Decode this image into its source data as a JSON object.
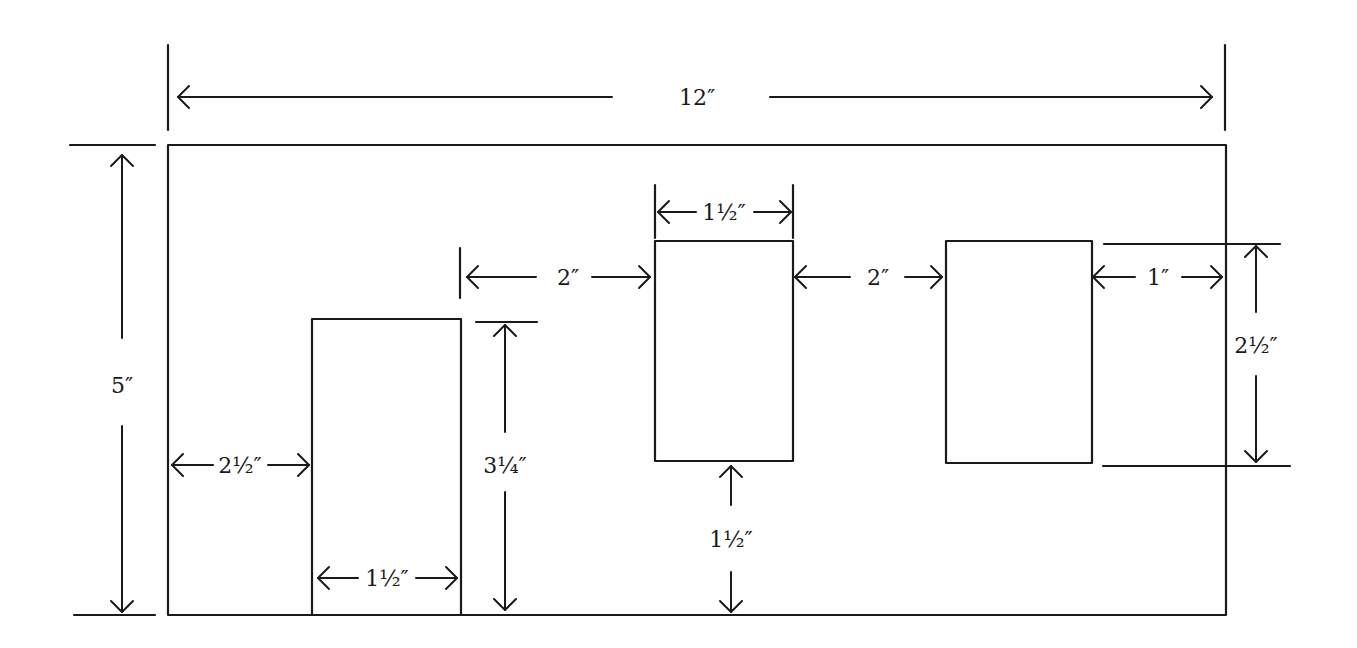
{
  "diagram": {
    "stroke_color": "#1a1a1a",
    "background": "#ffffff",
    "wall": {
      "x1": 168,
      "y1": 145,
      "x2": 1226,
      "y2": 615,
      "width_label": "12″",
      "height_label": "5″"
    },
    "openings": [
      {
        "name": "opening-left",
        "x1": 312,
        "y1": 319,
        "x2": 461,
        "y2": 615
      },
      {
        "name": "opening-center",
        "x1": 655,
        "y1": 241,
        "x2": 793,
        "y2": 461
      },
      {
        "name": "opening-right",
        "x1": 946,
        "y1": 241,
        "x2": 1092,
        "y2": 463
      }
    ],
    "dimensions": [
      {
        "id": "overall-width",
        "label": "12″",
        "orient": "h",
        "a": 178,
        "b": 1212,
        "at": 97,
        "tx": 697,
        "ty": 105,
        "gap": [
          612,
          770
        ]
      },
      {
        "id": "overall-height",
        "label": "5″",
        "orient": "v",
        "a": 155,
        "b": 612,
        "at": 122,
        "tx": 122,
        "ty": 393,
        "gap": [
          338,
          426
        ]
      },
      {
        "id": "left-margin",
        "label": "2½″",
        "orient": "h",
        "a": 172,
        "b": 309,
        "at": 465,
        "tx": 240,
        "ty": 473,
        "gap": [
          213,
          268
        ]
      },
      {
        "id": "left-opening-width",
        "label": "1½″",
        "orient": "h",
        "a": 318,
        "b": 457,
        "at": 578,
        "tx": 387,
        "ty": 586,
        "gap": [
          358,
          416
        ]
      },
      {
        "id": "left-opening-height",
        "label": "3¼″",
        "orient": "v",
        "a": 325,
        "b": 610,
        "at": 505,
        "tx": 505,
        "ty": 473,
        "gap": [
          432,
          492
        ]
      },
      {
        "id": "gap-left-center",
        "label": "2″",
        "orient": "h",
        "a": 467,
        "b": 650,
        "at": 277,
        "tx": 568,
        "ty": 285,
        "gap": [
          536,
          592
        ]
      },
      {
        "id": "center-opening-width",
        "label": "1½″",
        "orient": "h",
        "a": 658,
        "b": 791,
        "at": 212,
        "tx": 724,
        "ty": 220,
        "gap": [
          696,
          754
        ]
      },
      {
        "id": "center-bottom-margin",
        "label": "1½″",
        "orient": "v",
        "a": 466,
        "b": 612,
        "at": 731,
        "tx": 731,
        "ty": 547,
        "gap": [
          505,
          572
        ]
      },
      {
        "id": "gap-center-right",
        "label": "2″",
        "orient": "h",
        "a": 795,
        "b": 942,
        "at": 277,
        "tx": 878,
        "ty": 285,
        "gap": [
          850,
          905
        ]
      },
      {
        "id": "right-margin",
        "label": "1″",
        "orient": "h",
        "a": 1093,
        "b": 1222,
        "at": 277,
        "tx": 1158,
        "ty": 285,
        "gap": [
          1135,
          1182
        ]
      },
      {
        "id": "right-opening-height",
        "label": "2½″",
        "orient": "v",
        "a": 246,
        "b": 462,
        "at": 1256,
        "tx": 1256,
        "ty": 353,
        "gap": [
          312,
          376
        ]
      }
    ],
    "extension_lines": [
      {
        "x1": 168,
        "y1": 45,
        "x2": 168,
        "y2": 130
      },
      {
        "x1": 1225,
        "y1": 45,
        "x2": 1225,
        "y2": 130
      },
      {
        "x1": 70,
        "y1": 145,
        "x2": 155,
        "y2": 145
      },
      {
        "x1": 74,
        "y1": 615,
        "x2": 155,
        "y2": 615
      },
      {
        "x1": 476,
        "y1": 322,
        "x2": 537,
        "y2": 322
      },
      {
        "x1": 460,
        "y1": 248,
        "x2": 460,
        "y2": 298
      },
      {
        "x1": 655,
        "y1": 185,
        "x2": 655,
        "y2": 238
      },
      {
        "x1": 793,
        "y1": 185,
        "x2": 793,
        "y2": 238
      },
      {
        "x1": 1104,
        "y1": 244,
        "x2": 1280,
        "y2": 244
      },
      {
        "x1": 1103,
        "y1": 466,
        "x2": 1290,
        "y2": 466
      }
    ]
  }
}
